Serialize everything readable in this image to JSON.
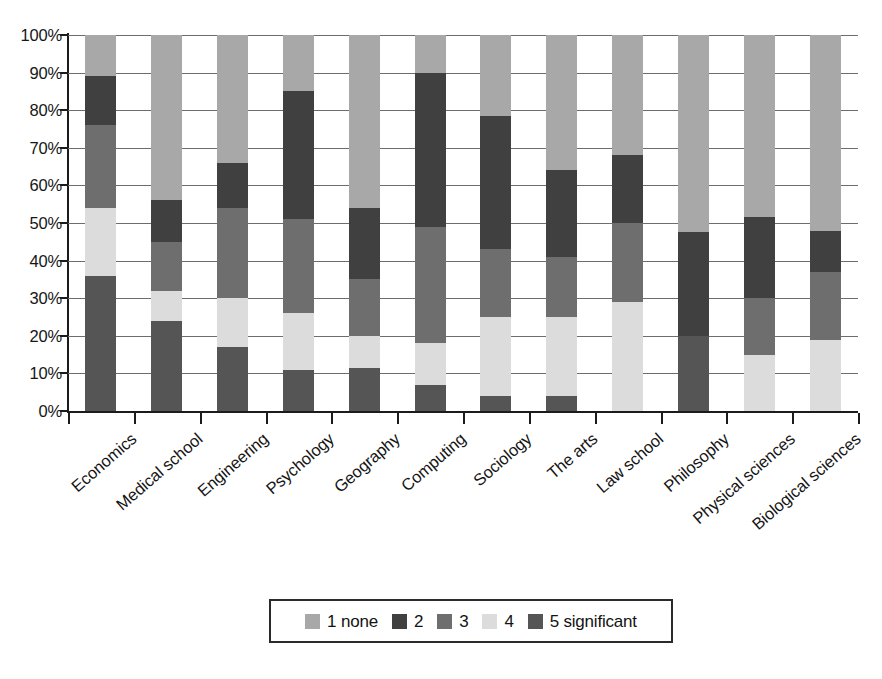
{
  "chart_data": {
    "type": "bar",
    "subtype": "stacked-percentage-column",
    "title": "",
    "subtitle": "",
    "xlabel": "",
    "ylabel": "",
    "ylim": [
      0,
      100
    ],
    "y_unit": "%",
    "grid": true,
    "legend_position": "bottom",
    "y_ticks": [
      "0%",
      "10%",
      "20%",
      "30%",
      "40%",
      "50%",
      "60%",
      "70%",
      "80%",
      "90%",
      "100%"
    ],
    "y_tick_values": [
      0,
      10,
      20,
      30,
      40,
      50,
      60,
      70,
      80,
      90,
      100
    ],
    "categories": [
      "Economics",
      "Medical school",
      "Engineering",
      "Psychology",
      "Geography",
      "Computing",
      "Sociology",
      "The arts",
      "Law school",
      "Philosophy",
      "Physical sciences",
      "Biological sciences"
    ],
    "series": [
      {
        "name": "1 none",
        "color": "#a8a8a8",
        "values": [
          11,
          44,
          34,
          15,
          46,
          10,
          21.5,
          36,
          32,
          52.5,
          48.5,
          52
        ]
      },
      {
        "name": "2",
        "color": "#404040",
        "values": [
          13,
          11,
          12,
          34,
          19,
          41,
          35.5,
          23,
          18,
          27.5,
          21.5,
          11
        ]
      },
      {
        "name": "3",
        "color": "#6e6e6e",
        "values": [
          22,
          13,
          24,
          25,
          15,
          31,
          18,
          16,
          21,
          0,
          15,
          18
        ]
      },
      {
        "name": "4",
        "color": "#dcdcdc",
        "values": [
          18,
          8,
          13,
          15,
          8.5,
          11,
          21,
          21,
          29,
          0,
          15,
          19
        ]
      },
      {
        "name": "5 significant",
        "color": "#555555",
        "values": [
          36,
          24,
          17,
          11,
          11.5,
          7,
          4,
          4,
          0,
          20,
          0,
          0
        ]
      }
    ],
    "stack_order_bottom_to_top": [
      "5 significant",
      "4",
      "3",
      "2",
      "1 none"
    ]
  },
  "legend": {
    "items": [
      {
        "label": "1 none",
        "color": "#a8a8a8"
      },
      {
        "label": "2",
        "color": "#404040"
      },
      {
        "label": "3",
        "color": "#6e6e6e"
      },
      {
        "label": "4",
        "color": "#dcdcdc"
      },
      {
        "label": "5 significant",
        "color": "#555555"
      }
    ]
  },
  "colors": {
    "axis": "#1b1b1b",
    "gridline": "#6d6d6d",
    "background": "#ffffff",
    "text": "#141414"
  }
}
